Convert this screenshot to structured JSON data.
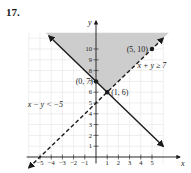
{
  "problem_number": "17.",
  "chart_data": {
    "type": "line",
    "title": "",
    "xlabel": "x",
    "ylabel": "y",
    "xlim": [
      -6,
      6
    ],
    "ylim": [
      0,
      11.5
    ],
    "grid": true,
    "x_ticks": [
      -5,
      -4,
      -3,
      -2,
      -1,
      1,
      2,
      3,
      4,
      5
    ],
    "x_tick_labels": [
      "−5",
      "−4",
      "−3",
      "−2",
      "−1",
      "1",
      "2",
      "3",
      "4",
      "5"
    ],
    "y_ticks": [
      1,
      2,
      3,
      4,
      5,
      6,
      7,
      8,
      9,
      10
    ],
    "y_tick_labels": [
      "1",
      "2",
      "3",
      "4",
      "5",
      "6",
      "7",
      "8",
      "9",
      "10"
    ],
    "series": [
      {
        "name": "x + y ≥ 7",
        "equation": "x + y = 7",
        "style": "solid",
        "x": [
          -4.2,
          6
        ],
        "y": [
          11.2,
          1
        ]
      },
      {
        "name": "x − y < −5",
        "equation": "x − y = −5",
        "style": "dashed",
        "x": [
          -6,
          6
        ],
        "y": [
          -1,
          11
        ]
      }
    ],
    "shaded_region": "x + y ≥ 7 and x − y < −5 (above both lines)",
    "points": [
      {
        "label": "(5, 10)",
        "x": 5,
        "y": 10
      },
      {
        "label": "(0, 7)",
        "x": 0,
        "y": 7
      },
      {
        "label": "(1, 6)",
        "x": 1,
        "y": 6
      }
    ],
    "annotations": [
      "x + y ≥ 7",
      "x − y < −5"
    ],
    "shade_color": "#c8c8c8",
    "line_color": "#1a1a1a"
  }
}
